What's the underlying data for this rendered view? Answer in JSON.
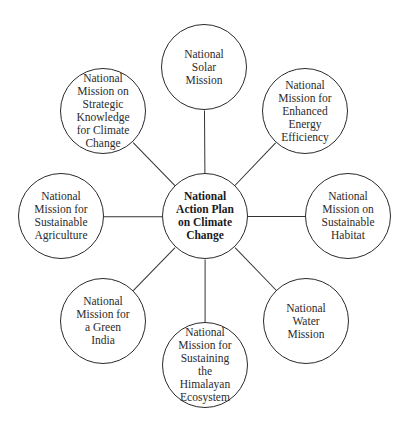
{
  "diagram": {
    "title": "National Action Plan on Climate Change",
    "center": {
      "lines": [
        "National",
        "Action Plan",
        "on Climate",
        "Change"
      ],
      "x": 205,
      "y": 216
    },
    "nodes": [
      {
        "id": "solar",
        "lines": [
          "National",
          "Solar",
          "Mission"
        ],
        "x": 204,
        "y": 67
      },
      {
        "id": "enhanced-energy-efficiency",
        "lines": [
          "National",
          "Mission for",
          "Enhanced",
          "Energy",
          "Efficiency"
        ],
        "x": 305,
        "y": 111
      },
      {
        "id": "sustainable-habitat",
        "lines": [
          "National",
          "Mission on",
          "Sustainable",
          "Habitat"
        ],
        "x": 348,
        "y": 216
      },
      {
        "id": "water",
        "lines": [
          "National",
          "Water",
          "Mission"
        ],
        "x": 306,
        "y": 321
      },
      {
        "id": "himalayan-ecosystem",
        "lines": [
          "National",
          "Mission for",
          "Sustaining",
          "the",
          "Himalayan",
          "Ecosystem"
        ],
        "x": 205,
        "y": 365
      },
      {
        "id": "green-india",
        "lines": [
          "National",
          "Mission for",
          "a Green",
          "India"
        ],
        "x": 103,
        "y": 321
      },
      {
        "id": "sustainable-agriculture",
        "lines": [
          "National",
          "Mission for",
          "Sustainable",
          "Agriculture"
        ],
        "x": 61,
        "y": 216
      },
      {
        "id": "strategic-knowledge",
        "lines": [
          "National",
          "Mission on",
          "Strategic",
          "Knowledge",
          "for Climate",
          "Change"
        ],
        "x": 103,
        "y": 111
      }
    ],
    "radius": 43,
    "stroke_color": "#2a2a2a",
    "background": "#ffffff"
  }
}
